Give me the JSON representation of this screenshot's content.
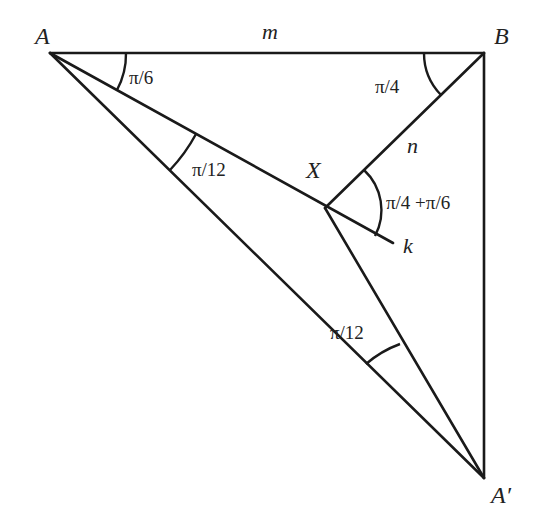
{
  "diagram": {
    "type": "geometry",
    "points": {
      "A": {
        "label": "A",
        "x": 50,
        "y": 53
      },
      "B": {
        "label": "B",
        "x": 484,
        "y": 53
      },
      "X": {
        "label": "X",
        "x": 325,
        "y": 208
      },
      "A_prime": {
        "label": "A′",
        "x": 484,
        "y": 478
      },
      "k_end": {
        "x": 393,
        "y": 243
      }
    },
    "segments": [
      {
        "from": "A",
        "to": "B",
        "label": "m"
      },
      {
        "from": "B",
        "to": "A_prime"
      },
      {
        "from": "A",
        "to": "A_prime"
      },
      {
        "from": "A",
        "to": "k_end",
        "label": "k"
      },
      {
        "from": "B",
        "to": "X",
        "label": "n"
      },
      {
        "from": "X",
        "to": "A_prime"
      }
    ],
    "labels": {
      "m": "m",
      "n": "n",
      "k": "k"
    },
    "angles": {
      "at_A_top": "π/6",
      "at_A_bottom": "π/12",
      "at_B": "π/4",
      "at_X": "π/4 +π/6",
      "at_A_prime": "π/12"
    }
  }
}
